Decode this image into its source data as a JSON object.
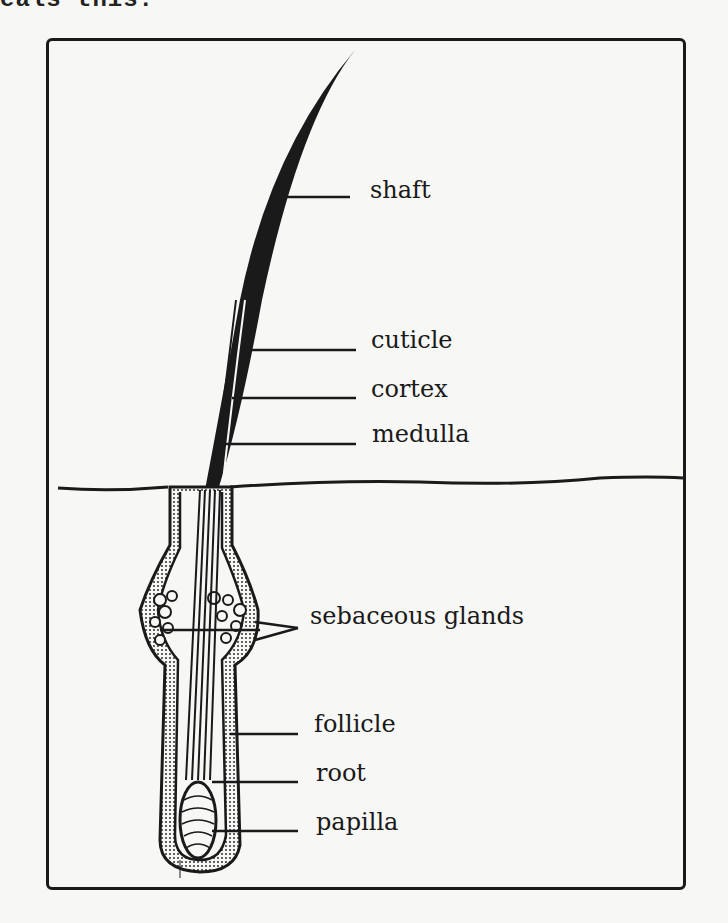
{
  "caption_fragment": "eals this:",
  "diagram": {
    "labels": [
      {
        "id": "shaft",
        "text": "shaft"
      },
      {
        "id": "cuticle",
        "text": "cuticle"
      },
      {
        "id": "cortex",
        "text": "cortex"
      },
      {
        "id": "medulla",
        "text": "medulla"
      },
      {
        "id": "sebaceous-glands",
        "text": "sebaceous glands"
      },
      {
        "id": "follicle",
        "text": "follicle"
      },
      {
        "id": "root",
        "text": "root"
      },
      {
        "id": "papilla",
        "text": "papilla"
      }
    ]
  },
  "colors": {
    "ink": "#1a1a1a",
    "paper": "#f7f7f5"
  }
}
